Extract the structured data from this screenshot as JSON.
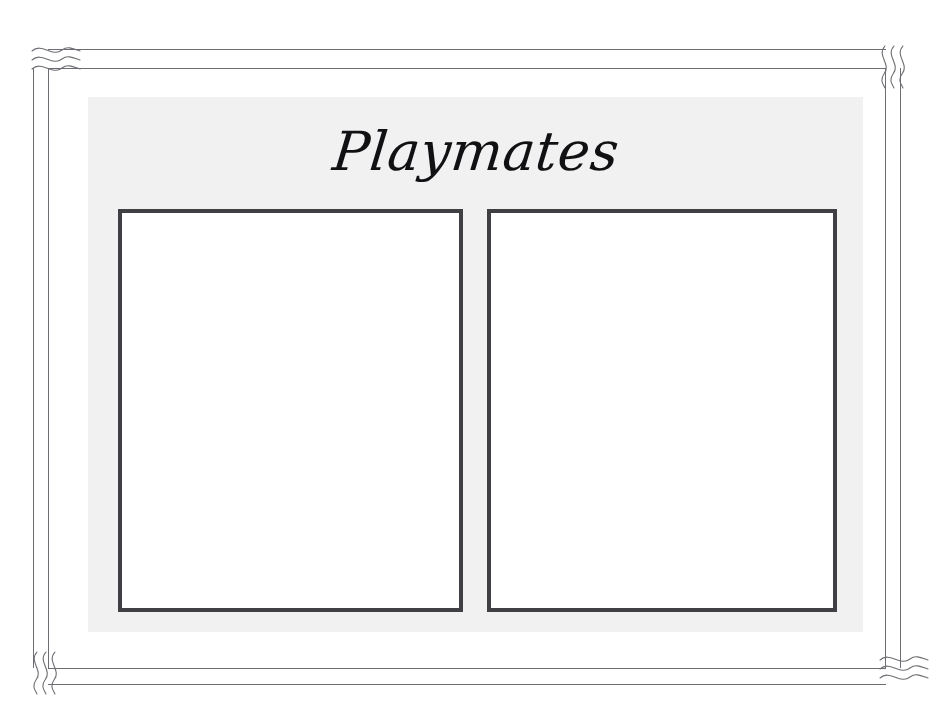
{
  "page": {
    "title": "Playmates",
    "background_color": "#ffffff",
    "width": 952,
    "height": 716
  },
  "panel": {
    "name": "inner-panel",
    "background_color": "#f1f1f2"
  },
  "border": {
    "name": "decorative-double-rule-border",
    "line_color": "#6d6d73",
    "style": "double-thin-rule",
    "corner_ornaments": [
      {
        "position": "top-left",
        "motif": "three-horizontal-s-waves"
      },
      {
        "position": "top-right",
        "motif": "three-vertical-s-squiggles"
      },
      {
        "position": "bottom-left",
        "motif": "three-vertical-s-squiggles"
      },
      {
        "position": "bottom-right",
        "motif": "three-horizontal-s-waves"
      }
    ]
  },
  "heading": {
    "text": "Playmates",
    "color": "#111114",
    "style": "script-italic"
  },
  "photo_frames": [
    {
      "name": "photo-frame-left",
      "label": "",
      "border_color": "#3f3f44",
      "fill_color": "#ffffff",
      "empty": true
    },
    {
      "name": "photo-frame-right",
      "label": "",
      "border_color": "#3f3f44",
      "fill_color": "#ffffff",
      "empty": true
    }
  ]
}
